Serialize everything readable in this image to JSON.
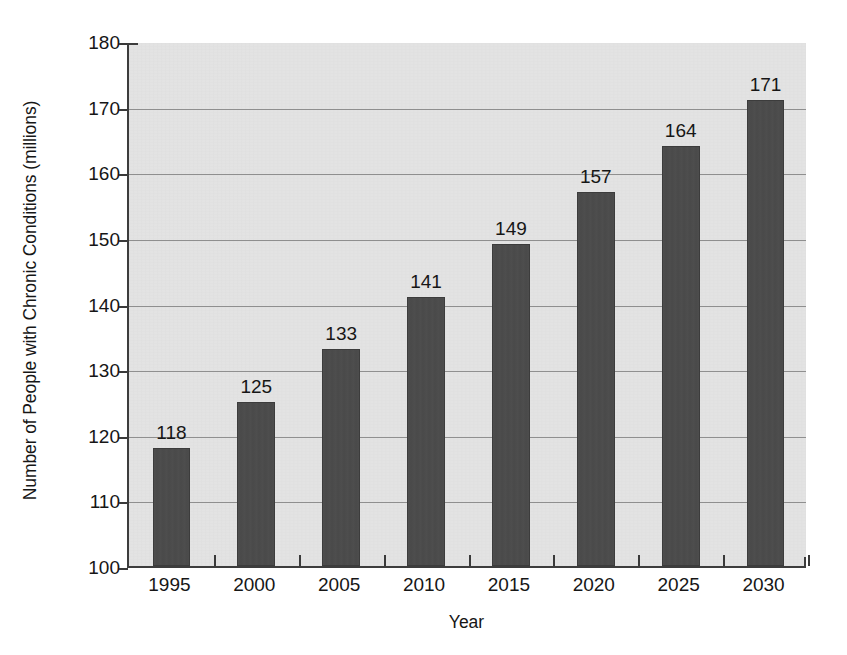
{
  "chart_data": {
    "type": "bar",
    "title": "",
    "xlabel": "Year",
    "ylabel": "Number of People with Chronic Conditions (millions)",
    "categories": [
      "1995",
      "2000",
      "2005",
      "2010",
      "2015",
      "2020",
      "2025",
      "2030"
    ],
    "values": [
      118,
      125,
      133,
      141,
      149,
      157,
      164,
      171
    ],
    "value_labels": [
      "118",
      "125",
      "133",
      "141",
      "149",
      "157",
      "164",
      "171"
    ],
    "ylim": [
      100,
      180
    ],
    "ytick_values": [
      100,
      110,
      120,
      130,
      140,
      150,
      160,
      170,
      180
    ],
    "ytick_labels": [
      "100",
      "110",
      "120",
      "130",
      "140",
      "150",
      "160",
      "170",
      "180"
    ],
    "grid": "horizontal",
    "legend": "none",
    "colors": {
      "bar": "#4b4b4b",
      "plot_background": "#e3e3e3",
      "page_background": "#ffffff",
      "gridline": "#8f8f8f",
      "axis": "#3d3d3d",
      "text": "#161616"
    }
  }
}
